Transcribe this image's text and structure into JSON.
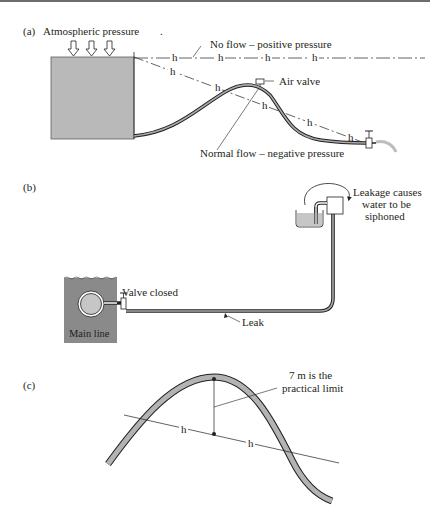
{
  "panels": {
    "a": {
      "label": "(a)",
      "title": "Atmospheric pressure",
      "no_flow_label": "No flow – positive pressure",
      "air_valve_label": "Air valve",
      "normal_flow_label": "Normal flow – negative pressure",
      "h_marker": "h",
      "dot": "."
    },
    "b": {
      "label": "(b)",
      "main_line_label": "Main line",
      "valve_closed_label": "Valve closed",
      "leak_label": "Leak",
      "siphon_label_1": "Leakage causes",
      "siphon_label_2": "water to be",
      "siphon_label_3": "siphoned"
    },
    "c": {
      "label": "(c)",
      "limit_label_1": "7 m is the",
      "limit_label_2": "practical limit",
      "h_marker": "h"
    }
  },
  "colors": {
    "water_fill": "#c6c6c6",
    "tank_fill": "#b9b9b9",
    "main_box_fill": "#8a8a8a",
    "pipe_fill": "#a9a9a9",
    "line": "#231f20",
    "outlet_flow": "#bdbdbd"
  }
}
